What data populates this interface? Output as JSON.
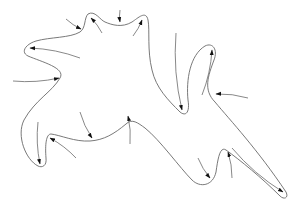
{
  "diagram": {
    "type": "closed-curve-with-arrows",
    "stroke_color": "#6a6a6a",
    "arrowhead_color": "#111111",
    "outline_path": "M 88 14 C 95 10, 100 20, 105 22 C 112 25, 122 28, 132 22 C 138 18, 146 10, 148 20 C 150 30, 147 50, 152 70 C 156 88, 168 100, 180 112 C 186 117, 190 112, 188 100 C 186 80, 190 55, 205 46 C 213 42, 218 50, 214 60 C 208 76, 203 90, 215 102 C 230 120, 258 150, 286 192 C 289 198, 284 200, 280 196 C 262 178, 240 160, 226 150 C 220 146, 218 158, 216 172 C 213 186, 200 188, 192 180 C 180 168, 160 140, 145 128 C 138 123, 132 118, 126 124 C 114 134, 104 140, 90 141 C 75 142, 60 135, 51 134 C 46 134, 45 145, 46 158 C 47 166, 42 168, 38 166 C 26 160, 16 136, 24 120 C 35 100, 52 92, 60 78 C 66 68, 42 62, 28 56 C 20 52, 26 44, 36 41 C 50 37, 70 38, 80 32 C 86 28, 84 18, 88 14 Z",
    "arrows": [
      {
        "name": "arrow-1",
        "from": [
          66,
          19
        ],
        "to": [
          81,
          29
        ]
      },
      {
        "name": "arrow-2",
        "from": [
          102,
          33
        ],
        "to": [
          91,
          18
        ]
      },
      {
        "name": "arrow-3",
        "from": [
          120,
          10
        ],
        "to": [
          120,
          22
        ]
      },
      {
        "name": "arrow-4",
        "from": [
          133,
          36
        ],
        "to": [
          142,
          20
        ]
      },
      {
        "name": "arrow-5",
        "from": [
          80,
          58
        ],
        "to": [
          30,
          48
        ]
      },
      {
        "name": "arrow-6",
        "from": [
          13,
          81
        ],
        "to": [
          59,
          78
        ]
      },
      {
        "name": "arrow-7",
        "from": [
          176,
          33
        ],
        "to": [
          182,
          110
        ]
      },
      {
        "name": "arrow-8",
        "from": [
          202,
          95
        ],
        "to": [
          212,
          50
        ]
      },
      {
        "name": "arrow-9",
        "from": [
          248,
          98
        ],
        "to": [
          216,
          94
        ]
      },
      {
        "name": "arrow-10",
        "from": [
          38,
          122
        ],
        "to": [
          40,
          164
        ]
      },
      {
        "name": "arrow-11",
        "from": [
          76,
          158
        ],
        "to": [
          50,
          138
        ]
      },
      {
        "name": "arrow-12",
        "from": [
          80,
          112
        ],
        "to": [
          92,
          138
        ]
      },
      {
        "name": "arrow-13",
        "from": [
          130,
          144
        ],
        "to": [
          128,
          116
        ]
      },
      {
        "name": "arrow-14",
        "from": [
          198,
          158
        ],
        "to": [
          210,
          178
        ]
      },
      {
        "name": "arrow-15",
        "from": [
          232,
          178
        ],
        "to": [
          228,
          152
        ]
      },
      {
        "name": "arrow-16",
        "from": [
          232,
          148
        ],
        "to": [
          283,
          192
        ]
      }
    ]
  }
}
